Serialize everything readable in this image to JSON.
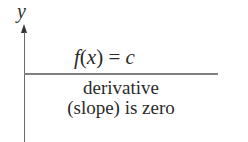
{
  "diagram": {
    "y_axis_label": "y",
    "function_label": {
      "f": "f",
      "open_paren": "(",
      "x": "x",
      "close_paren": ")",
      "equals": " = ",
      "c": "c"
    },
    "caption": {
      "line1": "derivative",
      "line2": "(slope) is zero"
    },
    "colors": {
      "axis": "#6a6a6a",
      "constant_line": "#808080",
      "text": "#2a2a2a"
    }
  }
}
